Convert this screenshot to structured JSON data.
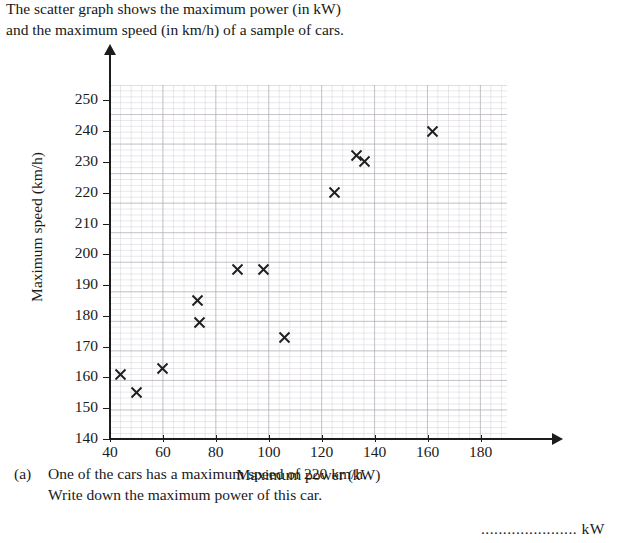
{
  "intro": {
    "line1": "The scatter graph shows the maximum power (in kW)",
    "line2": "and the maximum speed (in km/h) of a sample of cars."
  },
  "chart_data": {
    "type": "scatter",
    "title": "",
    "xlabel": "Maximum power (kW)",
    "ylabel": "Maximum speed (km/h)",
    "xlim": [
      40,
      190
    ],
    "ylim": [
      140,
      255
    ],
    "xticks": [
      40,
      60,
      80,
      100,
      120,
      140,
      160,
      180
    ],
    "yticks": [
      140,
      150,
      160,
      170,
      180,
      190,
      200,
      210,
      220,
      230,
      240,
      250
    ],
    "grid": true,
    "minor_grid": true,
    "legend": "none",
    "marker": "x",
    "marker_color": "#1f1f1f",
    "points": [
      {
        "x": 44,
        "y": 161
      },
      {
        "x": 50,
        "y": 155
      },
      {
        "x": 60,
        "y": 163
      },
      {
        "x": 73,
        "y": 185
      },
      {
        "x": 74,
        "y": 178
      },
      {
        "x": 88,
        "y": 195
      },
      {
        "x": 98,
        "y": 195
      },
      {
        "x": 106,
        "y": 173
      },
      {
        "x": 125,
        "y": 220
      },
      {
        "x": 133,
        "y": 232
      },
      {
        "x": 136,
        "y": 230
      },
      {
        "x": 162,
        "y": 240
      }
    ]
  },
  "question": {
    "marker": "(a)",
    "line1": "One of the cars has a maximum speed of 220 km/h.",
    "line2": "Write down the maximum power of this car.",
    "answer_dots": "......................",
    "answer_unit": "kW",
    "marks": "[1]"
  }
}
